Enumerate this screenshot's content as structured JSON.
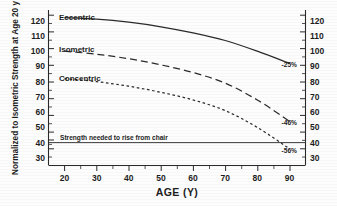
{
  "chart_data": {
    "type": "line",
    "title": "",
    "subtitle": "",
    "xlabel": "AGE (Y)",
    "ylabel": "Normalized to Isometric Strength at Age 20 y",
    "ylabel_right": "",
    "xlim": [
      15,
      95
    ],
    "ylim": [
      25,
      127
    ],
    "xticks": [
      20,
      30,
      40,
      50,
      60,
      70,
      80,
      90
    ],
    "xtick_labels": [
      "20",
      "30",
      "40",
      "50",
      "60",
      "70",
      "80",
      "90"
    ],
    "yticks": [
      30,
      40,
      50,
      60,
      70,
      80,
      90,
      100,
      110,
      120
    ],
    "ytick_labels": [
      "30",
      "40",
      "50",
      "60",
      "70",
      "80",
      "90",
      "100",
      "110",
      "120"
    ],
    "yticks_right": [
      30,
      40,
      50,
      60,
      70,
      80,
      90,
      100,
      110,
      120
    ],
    "ytick_labels_right": [
      "30",
      "40",
      "50",
      "60",
      "70",
      "80",
      "90",
      "100",
      "110",
      "120"
    ],
    "y_minor_step": 5,
    "grid": false,
    "legend_position": "inline-curve-labels",
    "x": [
      20,
      30,
      40,
      50,
      60,
      70,
      80,
      90
    ],
    "series": [
      {
        "name": "Eccentric",
        "label": "Eccentric",
        "style": "solid",
        "values": [
          122,
          121,
          119,
          116,
          112,
          107,
          100,
          92
        ],
        "end_annotation": "-25%"
      },
      {
        "name": "Isometric",
        "label": "Isometric",
        "style": "dashed",
        "values": [
          100,
          98,
          95,
          91,
          86,
          79,
          68,
          54
        ],
        "end_annotation": "-46%"
      },
      {
        "name": "Concentric",
        "label": "Concentric",
        "style": "dotted",
        "values": [
          82,
          80,
          77,
          73,
          68,
          61,
          50,
          36
        ],
        "end_annotation": "-56%"
      }
    ],
    "reference_line": {
      "label": "Strength needed to rise from chair",
      "y_value": 40,
      "orientation": "horizontal"
    },
    "annotations": [
      {
        "text": "Eccentric",
        "x": 27,
        "y": 127
      },
      {
        "text": "Isometric",
        "x": 27,
        "y": 105
      },
      {
        "text": "Concentric",
        "x": 27,
        "y": 86
      },
      {
        "text": "-25%",
        "x": 90,
        "y": 88
      },
      {
        "text": "-46%",
        "x": 90,
        "y": 51
      },
      {
        "text": "-56%",
        "x": 90,
        "y": 33
      },
      {
        "text": "Strength needed to rise from chair",
        "x": 24,
        "y": 42
      }
    ]
  }
}
